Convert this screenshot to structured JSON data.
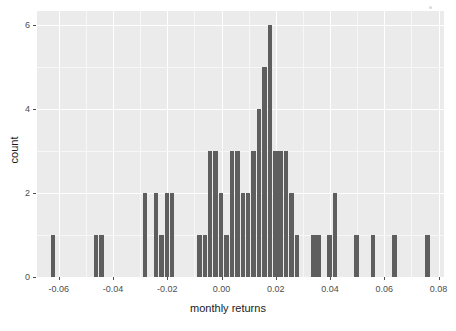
{
  "chart_data": {
    "type": "bar",
    "title": "",
    "subtitle": "",
    "xlabel": "monthly returns",
    "ylabel": "count",
    "xlim": [
      -0.068,
      0.082
    ],
    "ylim": [
      0,
      6
    ],
    "binwidth": 0.002,
    "grid": true,
    "legend": null,
    "legend_position": "none",
    "xticks": [
      -0.06,
      -0.04,
      -0.02,
      0.0,
      0.02,
      0.04,
      0.06,
      0.08
    ],
    "xtick_labels": [
      "-0.06",
      "-0.04",
      "-0.02",
      "0.00",
      "0.02",
      "0.04",
      "0.06",
      "0.08"
    ],
    "yticks": [
      0,
      2,
      4,
      6
    ],
    "ytick_labels": [
      "0",
      "2",
      "4",
      "6"
    ],
    "bar_color": "#5e5e5e",
    "panel_color": "#ebebeb",
    "grid_color": "#ffffff",
    "bins": [
      {
        "x": -0.063,
        "count": 1
      },
      {
        "x": -0.047,
        "count": 1
      },
      {
        "x": -0.045,
        "count": 1
      },
      {
        "x": -0.029,
        "count": 2
      },
      {
        "x": -0.025,
        "count": 2
      },
      {
        "x": -0.023,
        "count": 1
      },
      {
        "x": -0.021,
        "count": 2
      },
      {
        "x": -0.019,
        "count": 2
      },
      {
        "x": -0.009,
        "count": 1
      },
      {
        "x": -0.007,
        "count": 1
      },
      {
        "x": -0.005,
        "count": 3
      },
      {
        "x": -0.003,
        "count": 3
      },
      {
        "x": -0.001,
        "count": 2
      },
      {
        "x": 0.001,
        "count": 1
      },
      {
        "x": 0.003,
        "count": 3
      },
      {
        "x": 0.005,
        "count": 3
      },
      {
        "x": 0.007,
        "count": 2
      },
      {
        "x": 0.009,
        "count": 2
      },
      {
        "x": 0.011,
        "count": 3
      },
      {
        "x": 0.013,
        "count": 4
      },
      {
        "x": 0.015,
        "count": 5
      },
      {
        "x": 0.017,
        "count": 6
      },
      {
        "x": 0.019,
        "count": 3
      },
      {
        "x": 0.021,
        "count": 3
      },
      {
        "x": 0.023,
        "count": 3
      },
      {
        "x": 0.025,
        "count": 2
      },
      {
        "x": 0.027,
        "count": 1
      },
      {
        "x": 0.033,
        "count": 1
      },
      {
        "x": 0.035,
        "count": 1
      },
      {
        "x": 0.039,
        "count": 1
      },
      {
        "x": 0.041,
        "count": 2
      },
      {
        "x": 0.049,
        "count": 1
      },
      {
        "x": 0.055,
        "count": 1
      },
      {
        "x": 0.063,
        "count": 1
      },
      {
        "x": 0.075,
        "count": 1
      }
    ]
  },
  "axes": {
    "x_label": "monthly returns",
    "y_label": "count"
  }
}
